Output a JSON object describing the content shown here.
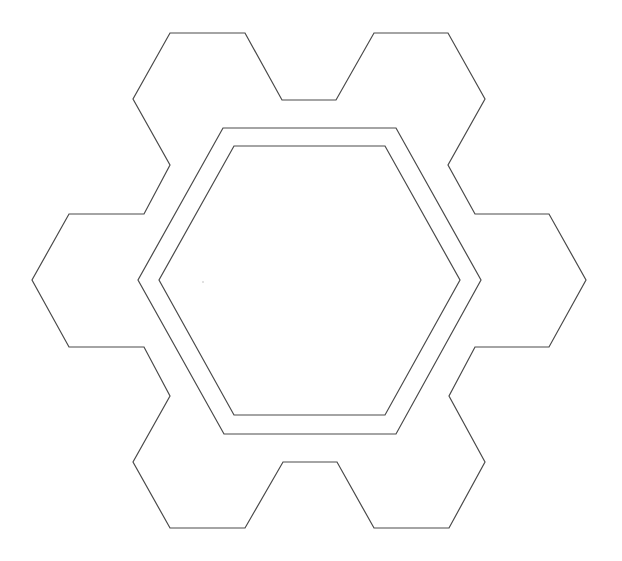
{
  "canvas": {
    "width": 622,
    "height": 561,
    "background": "#ffffff"
  },
  "stroke": {
    "color": "#4a4a4a",
    "width": 1.2
  },
  "shapes": {
    "outer_gear": {
      "points": "170,33 245,33 282,100 336,100 374,33 448,33 485,99 448,165 475,214 549,214 586,280 549,347 475,347 449,396 485,462 449,528 374,528 337,462 283,462 245,528 170,528 133,462 170,396 144,347 69,347 32,280 69,214 144,214 170,165 133,99"
    },
    "middle_hexagon": {
      "points": "223,128 396,128 481,280 396,434 224,434 138,280"
    },
    "inner_hexagon": {
      "points": "234,146 385,146 460,280 385,415 234,415 159,280"
    },
    "speck": {
      "cx": 203,
      "cy": 282,
      "r": 0.8,
      "color": "#bbbbbb"
    }
  }
}
